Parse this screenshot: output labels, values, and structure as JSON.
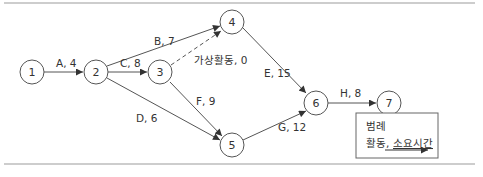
{
  "diagram": {
    "type": "activity-on-arrow network",
    "nodes": [
      {
        "id": "1",
        "label": "1",
        "x": 32,
        "y": 72
      },
      {
        "id": "2",
        "label": "2",
        "x": 96,
        "y": 72
      },
      {
        "id": "3",
        "label": "3",
        "x": 160,
        "y": 72
      },
      {
        "id": "4",
        "label": "4",
        "x": 232,
        "y": 22
      },
      {
        "id": "5",
        "label": "5",
        "x": 232,
        "y": 145
      },
      {
        "id": "6",
        "label": "6",
        "x": 316,
        "y": 103
      },
      {
        "id": "7",
        "label": "7",
        "x": 389,
        "y": 103
      }
    ],
    "edges": [
      {
        "from": "1",
        "to": "2",
        "activity": "A",
        "duration": 4,
        "label": "A, 4"
      },
      {
        "from": "2",
        "to": "4",
        "activity": "B",
        "duration": 7,
        "label": "B, 7"
      },
      {
        "from": "2",
        "to": "3",
        "activity": "C",
        "duration": 8,
        "label": "C, 8"
      },
      {
        "from": "2",
        "to": "5",
        "activity": "D",
        "duration": 6,
        "label": "D, 6"
      },
      {
        "from": "4",
        "to": "6",
        "activity": "E",
        "duration": 15,
        "label": "E, 15"
      },
      {
        "from": "3",
        "to": "5",
        "activity": "F",
        "duration": 9,
        "label": "F, 9"
      },
      {
        "from": "5",
        "to": "6",
        "activity": "G",
        "duration": 12,
        "label": "G, 12"
      },
      {
        "from": "6",
        "to": "7",
        "activity": "H",
        "duration": 8,
        "label": "H, 8"
      },
      {
        "from": "3",
        "to": "4",
        "activity": "가상활동",
        "duration": 0,
        "label": "가상활동, 0",
        "dummy": true
      }
    ]
  },
  "legend": {
    "title": "범례",
    "entry_activity": "활동,",
    "entry_duration": "소요시간"
  }
}
